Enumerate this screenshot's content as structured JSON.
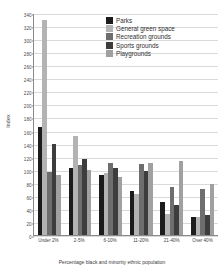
{
  "chart_data": {
    "type": "bar",
    "title": "",
    "xlabel": "Percentage black and minority ethnic population",
    "ylabel": "Index",
    "ylim": [
      0,
      340
    ],
    "ytick_step": 20,
    "yticks": [
      0,
      20,
      40,
      60,
      80,
      100,
      120,
      140,
      160,
      180,
      200,
      220,
      240,
      260,
      280,
      300,
      320,
      340
    ],
    "grid": true,
    "legend_position": "top-right",
    "categories": [
      "Under 2%",
      "2-5%",
      "6-10%",
      "11-20%",
      "21-40%",
      "Over 40%"
    ],
    "series": [
      {
        "name": "Parks",
        "color": "#1c1c1c",
        "values": [
          166,
          102,
          92,
          68,
          51,
          27
        ]
      },
      {
        "name": "General green space",
        "color": "#b3b3b3",
        "values": [
          329,
          152,
          95,
          63,
          32,
          27
        ]
      },
      {
        "name": "Recreation grounds",
        "color": "#6e6e6e",
        "values": [
          96,
          107,
          110,
          109,
          74,
          70
        ]
      },
      {
        "name": "Sports grounds",
        "color": "#3d3d3d",
        "values": [
          139,
          116,
          103,
          98,
          46,
          31
        ]
      },
      {
        "name": "Playgrounds",
        "color": "#a0a0a0",
        "values": [
          92,
          100,
          89,
          110,
          114,
          78
        ]
      }
    ]
  },
  "legend": {
    "items": [
      {
        "label": "Parks"
      },
      {
        "label": "General green space"
      },
      {
        "label": "Recreation grounds"
      },
      {
        "label": "Sports grounds"
      },
      {
        "label": "Playgrounds"
      }
    ]
  }
}
